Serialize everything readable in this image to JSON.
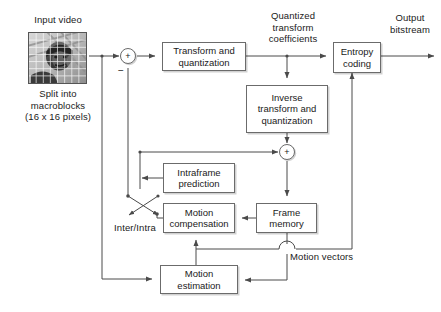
{
  "diagram": {
    "colors": {
      "line": "#4a4a4a",
      "box_border": "#6b6b6b",
      "text": "#1a1a1a",
      "background": "#ffffff"
    },
    "boxes": [
      {
        "id": "transform",
        "label": "Transform and\nquantization",
        "x": 162,
        "y": 42,
        "w": 84,
        "h": 29
      },
      {
        "id": "inverse",
        "label": "Inverse\ntransform and\nquantization",
        "x": 246,
        "y": 85,
        "w": 82,
        "h": 48
      },
      {
        "id": "entropy",
        "label": "Entropy\ncoding",
        "x": 333,
        "y": 42,
        "w": 48,
        "h": 31
      },
      {
        "id": "intraframe",
        "label": "Intraframe\nprediction",
        "x": 163,
        "y": 163,
        "w": 72,
        "h": 30
      },
      {
        "id": "motion-comp",
        "label": "Motion\ncompensation",
        "x": 163,
        "y": 203,
        "w": 72,
        "h": 30
      },
      {
        "id": "frame-memory",
        "label": "Frame\nmemory",
        "x": 256,
        "y": 203,
        "w": 61,
        "h": 30
      },
      {
        "id": "motion-est",
        "label": "Motion\nestimation",
        "x": 160,
        "y": 265,
        "w": 78,
        "h": 29
      }
    ],
    "adders": [
      {
        "id": "adder-difference",
        "symbol": "+",
        "cx": 128,
        "cy": 56,
        "r": 8,
        "minus_sign": "−"
      },
      {
        "id": "adder-reconstruct",
        "symbol": "+",
        "cx": 287,
        "cy": 152,
        "r": 8
      }
    ],
    "labels": [
      {
        "id": "input-video",
        "text": "Input video",
        "x": 24,
        "y": 14,
        "w": 68
      },
      {
        "id": "split-caption",
        "text": "Split into\nmacroblocks\n(16 x 16 pixels)",
        "x": 14,
        "y": 88,
        "w": 88
      },
      {
        "id": "quantized-coeffs",
        "text": "Quantized\ntransform\ncoefficients",
        "x": 255,
        "y": 10,
        "w": 76
      },
      {
        "id": "output-bitstream",
        "text": "Output\nbitstream",
        "x": 382,
        "y": 12,
        "w": 56
      },
      {
        "id": "inter-intra",
        "text": "Inter/Intra",
        "x": 108,
        "y": 222,
        "w": 54
      },
      {
        "id": "motion-vectors",
        "text": "Motion vectors",
        "x": 290,
        "y": 251,
        "w": 88
      }
    ],
    "thumbnail": {
      "id": "input-video-thumbnail",
      "x": 28,
      "y": 32,
      "w": 59,
      "h": 52,
      "description": "grayscale video frame with macroblock grid overlay",
      "grid_cols": 8,
      "grid_rows": 7
    },
    "switch": {
      "id": "inter-intra-switch",
      "label": "Inter/Intra",
      "pivot_x": 128,
      "pivot_y": 196,
      "throw_x": 157,
      "throw_y": 214
    },
    "signal_flow": [
      "Input video → difference adder (+)",
      "Difference adder → Transform and quantization",
      "Transform and quantization → Entropy coding (Quantized transform coefficients)",
      "Quantized transform coefficients → Inverse transform and quantization",
      "Inverse transform and quantization → reconstruction adder (+)",
      "Reconstruction adder → Frame memory",
      "Frame memory → Motion compensation",
      "Frame memory → Motion estimation",
      "Motion estimation → Motion compensation (Motion vectors)",
      "Motion vectors → Entropy coding",
      "Motion compensation / Intraframe prediction → Inter/Intra switch → difference adder (−)",
      "Entropy coding → Output bitstream"
    ]
  }
}
